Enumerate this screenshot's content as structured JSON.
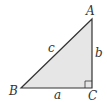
{
  "diagram": {
    "type": "right-triangle",
    "colors": {
      "fill": "#e6e6e6",
      "stroke": "#333333",
      "text": "#333333"
    },
    "vertices": {
      "A": {
        "label": "A",
        "x": 92,
        "y": 19
      },
      "B": {
        "label": "B",
        "x": 21,
        "y": 88
      },
      "C": {
        "label": "C",
        "x": 92,
        "y": 88
      }
    },
    "sides": {
      "a": {
        "label": "a"
      },
      "b": {
        "label": "b"
      },
      "c": {
        "label": "c"
      }
    },
    "right_angle_at": "C"
  }
}
